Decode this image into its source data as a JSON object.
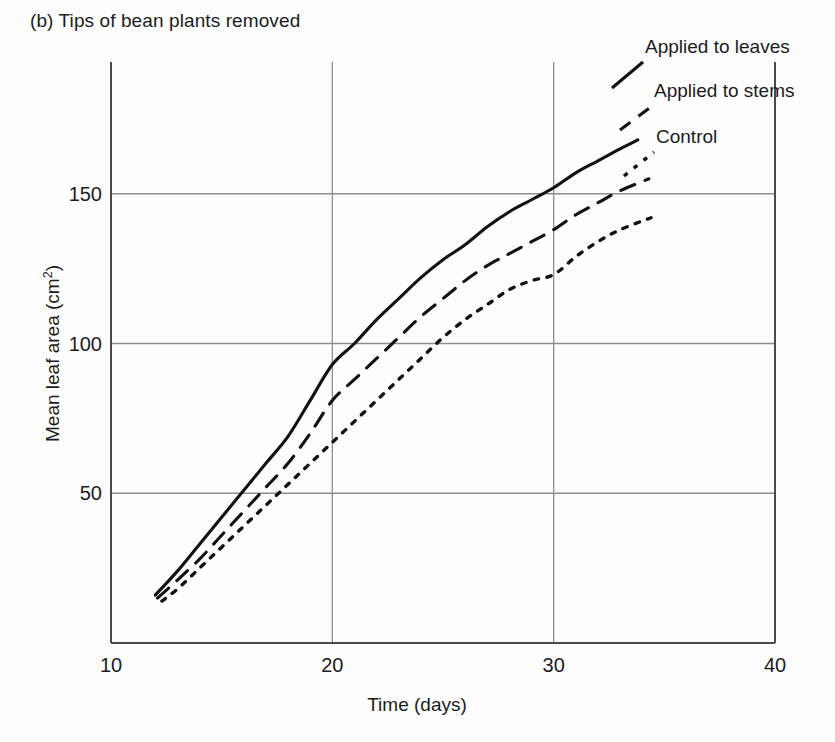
{
  "figure": {
    "panel_label": "(b) Tips of bean plants removed",
    "background_color": "#fdfdfd",
    "line_color": "#121212",
    "grid_color": "#8e8e8e",
    "axis_color": "#4a4a4a"
  },
  "chart_data": {
    "type": "line",
    "title": "(b) Tips of bean plants removed",
    "xlabel": "Time (days)",
    "ylabel_text": "Mean leaf area (cm",
    "ylabel_sup": "2",
    "ylabel_tail": ")",
    "ylabel_full": "Mean leaf area (cm2)",
    "xlim": [
      10,
      40
    ],
    "ylim": [
      0,
      194
    ],
    "xticks": [
      10,
      20,
      30,
      40
    ],
    "xtick_labels": [
      "10",
      "20",
      "30",
      "40"
    ],
    "yticks": [
      50,
      100,
      150
    ],
    "ytick_labels": [
      "50",
      "100",
      "150"
    ],
    "grid": "major-x-and-y",
    "legend_position": "in-plot-right-annotations",
    "series": [
      {
        "name": "Applied to leaves",
        "style": "solid",
        "x": [
          12.0,
          13.0,
          14.0,
          15.0,
          16.0,
          17.0,
          18.0,
          19.0,
          20.0,
          21.0,
          22.0,
          23.0,
          24.0,
          25.0,
          26.0,
          27.0,
          28.0,
          29.0,
          30.0,
          31.0,
          32.0,
          33.0,
          33.8
        ],
        "y": [
          16,
          24,
          33,
          42,
          51,
          60,
          69,
          81,
          93,
          100,
          108,
          115,
          122,
          128,
          133,
          139,
          144,
          148,
          152,
          157,
          161,
          165,
          168
        ]
      },
      {
        "name": "Applied to stems",
        "style": "dashed",
        "x": [
          12.1,
          13.0,
          14.0,
          15.0,
          16.0,
          17.0,
          18.0,
          19.0,
          20.0,
          21.0,
          22.0,
          23.0,
          24.0,
          25.0,
          26.0,
          27.0,
          28.0,
          29.0,
          30.0,
          31.0,
          32.0,
          33.0,
          34.3
        ],
        "y": [
          15,
          21,
          28,
          36,
          44,
          52,
          60,
          70,
          81,
          88,
          95,
          102,
          109,
          115,
          121,
          126,
          130,
          134,
          138,
          143,
          147,
          151,
          155
        ]
      },
      {
        "name": "Control",
        "style": "dotted",
        "x": [
          12.3,
          13.0,
          14.0,
          15.0,
          16.0,
          17.0,
          18.0,
          19.0,
          20.0,
          21.0,
          22.0,
          23.0,
          24.0,
          25.0,
          26.0,
          27.0,
          28.0,
          29.0,
          30.0,
          31.0,
          32.0,
          33.0,
          34.4
        ],
        "y": [
          14,
          18,
          25,
          32,
          39,
          46,
          53,
          60,
          67,
          74,
          81,
          88,
          95,
          102,
          108,
          113,
          118,
          121,
          123,
          129,
          134,
          138,
          142
        ]
      }
    ],
    "annotations": [
      {
        "label": "Applied to leaves",
        "series": "Applied to leaves"
      },
      {
        "label": "Applied to stems",
        "series": "Applied to stems"
      },
      {
        "label": "Control",
        "series": "Control"
      }
    ]
  }
}
